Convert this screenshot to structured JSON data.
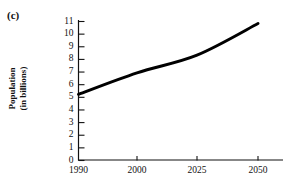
{
  "figure": {
    "panel_label": "(c)",
    "background_color": "#ffffff",
    "ink_color": "#111111"
  },
  "chart_data": {
    "type": "line",
    "title": "",
    "subtitle": "",
    "xlabel": "",
    "ylabel": "Population (in billions)",
    "ylabel_lines": [
      "Population",
      "(in billions)"
    ],
    "x": [
      1990,
      2000,
      2025,
      2050
    ],
    "values": [
      5.2,
      6.9,
      8.3,
      10.8
    ],
    "series": [
      {
        "name": "World population",
        "x": [
          1990,
          2000,
          2025,
          2050
        ],
        "values": [
          5.2,
          6.9,
          8.3,
          10.8
        ],
        "color": "#000000",
        "line_width": 3
      }
    ],
    "xtick_labels": [
      "1990",
      "2000",
      "2025",
      "2050"
    ],
    "xticks": [
      1990,
      2000,
      2025,
      2050
    ],
    "ytick_labels": [
      "0",
      "1",
      "2",
      "3",
      "4",
      "5",
      "6",
      "7",
      "8",
      "9",
      "10",
      "11"
    ],
    "yticks": [
      0,
      1,
      2,
      3,
      4,
      5,
      6,
      7,
      8,
      9,
      10,
      11
    ],
    "xlim": [
      1990,
      2055
    ],
    "ylim": [
      0,
      11
    ],
    "grid": false,
    "legend": false,
    "legend_position": "none",
    "axis_spines": [
      "left",
      "bottom"
    ],
    "ytick_direction": "in",
    "xtick_direction": "out",
    "annotations": []
  }
}
